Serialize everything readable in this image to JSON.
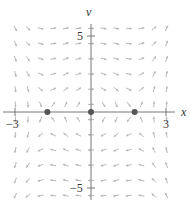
{
  "chart_data": {
    "type": "vector_field",
    "title": "",
    "system": {
      "dx_dt": "v",
      "dv_dt": "-3x + x^3"
    },
    "xlabel": "x",
    "ylabel": "v",
    "xlim": [
      -3.4,
      3.4
    ],
    "ylim": [
      -5.8,
      7.3
    ],
    "x_ticks": [
      {
        "value": -3,
        "label": "-3"
      },
      {
        "value": 3,
        "label": "3"
      }
    ],
    "y_ticks": [
      {
        "value": 5,
        "label": "5"
      },
      {
        "value": -5,
        "label": "-5"
      }
    ],
    "equilibria": [
      {
        "x": -1.73,
        "v": 0,
        "type": "saddle"
      },
      {
        "x": 0,
        "v": 0,
        "type": "center"
      },
      {
        "x": 1.73,
        "v": 0,
        "type": "saddle"
      }
    ],
    "field_grid": {
      "x_start": -3,
      "x_end": 3,
      "x_step": 0.5,
      "v_start": -5.5,
      "v_end": 5.5,
      "v_step": 1
    },
    "grid": false,
    "legend": null
  },
  "colors": {
    "axis": "#777777",
    "arrow": "#b8b8b8",
    "equilibrium": "#555555",
    "text": "#333333"
  },
  "labels": {
    "x_axis": "x",
    "v_axis": "v",
    "tick_x_neg3": "−3",
    "tick_x_3": "3",
    "tick_v_5": "5",
    "tick_v_neg5": "−5"
  }
}
